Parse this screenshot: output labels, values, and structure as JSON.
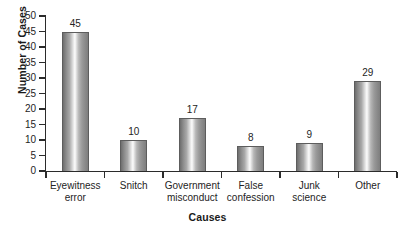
{
  "chart_data": {
    "type": "bar",
    "title": "",
    "xlabel": "Causes",
    "ylabel": "Number of Cases",
    "categories": [
      "Eyewitness error",
      "Snitch",
      "Government misconduct",
      "False confession",
      "Junk science",
      "Other"
    ],
    "category_lines": [
      [
        "Eyewitness",
        "error"
      ],
      [
        "Snitch",
        ""
      ],
      [
        "Government",
        "misconduct"
      ],
      [
        "False",
        "confession"
      ],
      [
        "Junk",
        "science"
      ],
      [
        "Other",
        ""
      ]
    ],
    "values": [
      45,
      10,
      17,
      8,
      9,
      29
    ],
    "value_labels": [
      "45",
      "10",
      "17",
      "8",
      "9",
      "29"
    ],
    "ylim": [
      0,
      50
    ],
    "ytick_step": 5,
    "yticks": [
      0,
      5,
      10,
      15,
      20,
      25,
      30,
      35,
      40,
      45,
      50
    ],
    "ytick_labels": [
      "0",
      "5",
      "10",
      "15",
      "20",
      "25",
      "30",
      "35",
      "40",
      "45",
      "50"
    ],
    "grid": false,
    "legend": null,
    "bar_fill": "grayscale-vertical-gradient",
    "bar_edge_color": "#5d5d5d",
    "axis_color": "#2b2b2b",
    "background": "#ffffff"
  }
}
